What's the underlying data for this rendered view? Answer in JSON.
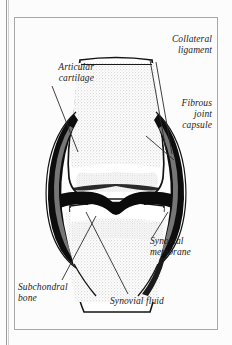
{
  "figure": {
    "background_color": "#fcfcfc",
    "frame_color": "#a8a8a8",
    "ink_color": "#1c1c1c",
    "bone_stipple_color": "#d8d8d8",
    "cortical_rim_color": "#ffffff",
    "capsule_fill_color": "#0d0d0d",
    "synovial_membrane_color": "#8f8f8f"
  },
  "labels": {
    "articular_cartilage": "Articular\ncartilage",
    "collateral_ligament": "Collateral\nligament",
    "fibrous_joint_capsule": "Fibrous\njoint\ncapsule",
    "synovial_membrane": "Synovial\nmembrane",
    "subchondral_bone": "Subchondral\nbone",
    "synovial_fluid": "Synovial fluid"
  }
}
